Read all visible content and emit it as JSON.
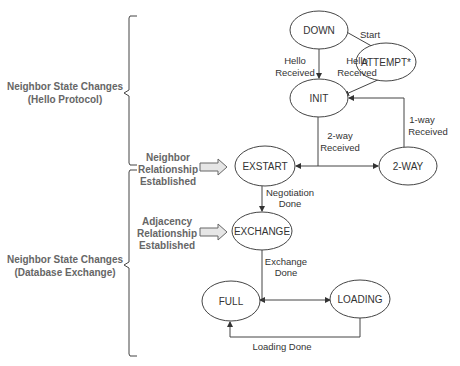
{
  "diagram": {
    "type": "state-machine",
    "groups": [
      {
        "id": "hello",
        "label_line1": "Neighbor State Changes",
        "label_line2": "(Hello Protocol)"
      },
      {
        "id": "dbex",
        "label_line1": "Neighbor State Changes",
        "label_line2": "(Database Exchange)"
      }
    ],
    "milestones": [
      {
        "id": "neighbor",
        "line1": "Neighbor",
        "line2": "Relationship",
        "line3": "Established"
      },
      {
        "id": "adjacency",
        "line1": "Adjacency",
        "line2": "Relationship",
        "line3": "Established"
      }
    ],
    "states": {
      "down": "DOWN",
      "attempt": "ATTEMPT*",
      "init": "INIT",
      "exstart": "EXSTART",
      "twoway": "2-WAY",
      "exchange": "EXCHANGE",
      "full": "FULL",
      "loading": "LOADING"
    },
    "transitions": {
      "start": {
        "line1": "Start"
      },
      "down_hello": {
        "line1": "Hello",
        "line2": "Received"
      },
      "attempt_hello": {
        "line1": "Hello",
        "line2": "Received"
      },
      "oneway": {
        "line1": "1-way",
        "line2": "Received"
      },
      "twoway_rcv": {
        "line1": "2-way",
        "line2": "Received"
      },
      "negotiation": {
        "line1": "Negotiation",
        "line2": "Done"
      },
      "exchange_done": {
        "line1": "Exchange",
        "line2": "Done"
      },
      "loading_done": {
        "line1": "Loading Done"
      }
    },
    "edges": [
      {
        "from": "DOWN",
        "to": "ATTEMPT*",
        "label": "Start"
      },
      {
        "from": "DOWN",
        "to": "INIT",
        "label": "Hello Received"
      },
      {
        "from": "ATTEMPT*",
        "to": "INIT",
        "label": "Hello Received"
      },
      {
        "from": "INIT",
        "to": "EXSTART",
        "label": "2-way Received"
      },
      {
        "from": "INIT",
        "to": "2-WAY",
        "label": "2-way Received"
      },
      {
        "from": "2-WAY",
        "to": "INIT",
        "label": "1-way Received"
      },
      {
        "from": "2-WAY",
        "to": "EXSTART",
        "label": ""
      },
      {
        "from": "EXSTART",
        "to": "EXCHANGE",
        "label": "Negotiation Done"
      },
      {
        "from": "EXCHANGE",
        "to": "FULL",
        "label": "Exchange Done"
      },
      {
        "from": "EXCHANGE",
        "to": "LOADING",
        "label": "Exchange Done"
      },
      {
        "from": "LOADING",
        "to": "FULL",
        "label": "Loading Done"
      }
    ]
  }
}
